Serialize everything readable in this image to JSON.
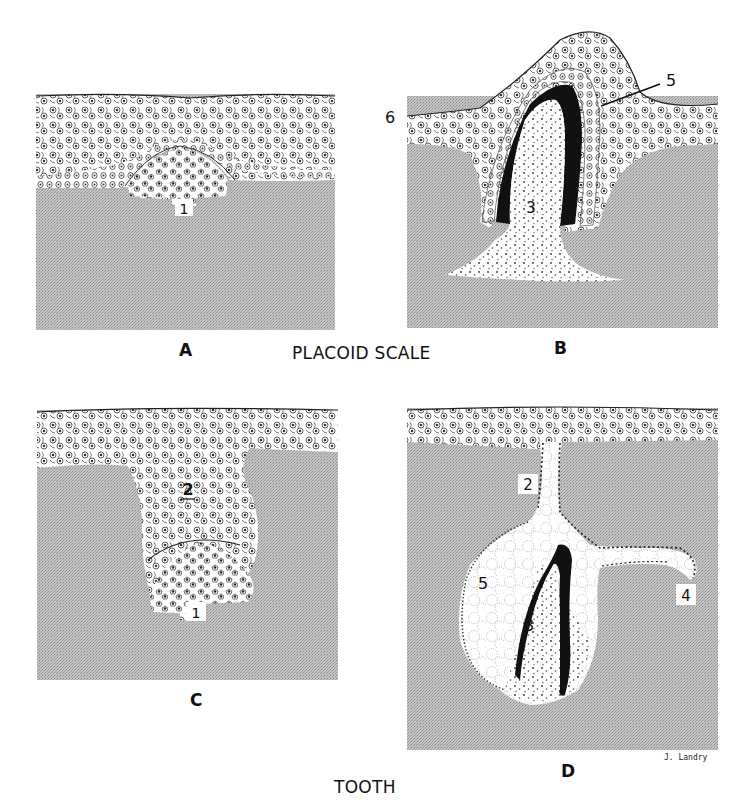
{
  "figure": {
    "sections": [
      {
        "title": "PLACOID SCALE",
        "panels": [
          "A",
          "B"
        ]
      },
      {
        "title": "TOOTH",
        "panels": [
          "C",
          "D"
        ]
      }
    ],
    "panels": {
      "A": {
        "letter": "A",
        "labels": [
          "1"
        ]
      },
      "B": {
        "letter": "B",
        "labels": [
          "3",
          "5",
          "6"
        ]
      },
      "C": {
        "letter": "C",
        "labels": [
          "2",
          "1"
        ]
      },
      "D": {
        "letter": "D",
        "labels": [
          "2",
          "3",
          "4",
          "5"
        ]
      }
    },
    "signature": "J. Landry",
    "colors": {
      "connective_tissue": "#b8b8b8",
      "epithelium": "#ffffff",
      "enamel_dentine": "#111111",
      "ink": "#222222"
    }
  }
}
